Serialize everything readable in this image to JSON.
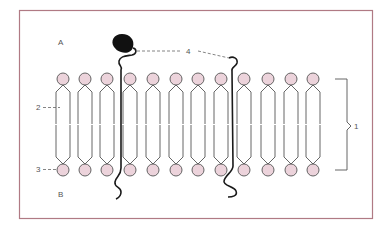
{
  "figure": {
    "frame_color": "#b07a84",
    "head_fill": "#ecd3db",
    "head_stroke": "#555555",
    "tail_stroke": "#555555",
    "protein_color": "#1a1a1a",
    "side_labels": {
      "top": "A",
      "bottom": "B"
    },
    "callouts": {
      "bilayer": "1",
      "fatty_acid_tail": "2",
      "polar_head": "3",
      "protein": "4"
    },
    "lipid_columns_x": [
      63,
      85,
      107,
      130,
      153,
      176,
      198,
      221,
      244,
      268,
      291,
      313
    ],
    "top_head_y": 79,
    "bottom_head_y": 170,
    "head_radius": 6
  }
}
